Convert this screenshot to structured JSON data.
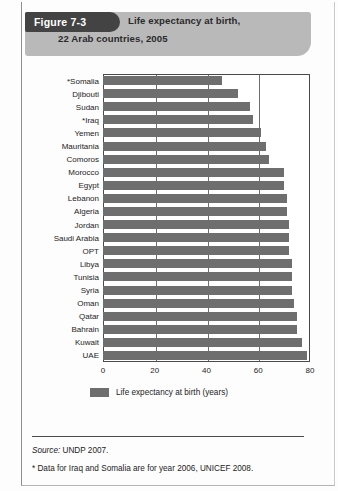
{
  "figure": {
    "tag": "Figure 7-3",
    "title_line1": "Life expectancy at birth,",
    "title_line2": "22 Arab countries, 2005"
  },
  "notes": {
    "source_label": "Source:",
    "source_value": "UNDP 2007.",
    "footnote": "* Data for Iraq and Somalia are for year 2006, UNICEF 2008."
  },
  "colors": {
    "bar": "#6e6e6e",
    "banner": "#b9b9b9",
    "tag_background": "#434343",
    "tag_text": "#ffffff",
    "axis": "#4a4a4a",
    "gridline": "#6e6e6e"
  },
  "chart_data": {
    "type": "bar",
    "orientation": "horizontal",
    "title": "Life expectancy at birth, 22 Arab countries, 2005",
    "xlabel": "",
    "ylabel": "",
    "xlim": [
      0,
      80
    ],
    "xticks": [
      0,
      20,
      40,
      60,
      80
    ],
    "tick_labels": [
      "0",
      "20",
      "40",
      "60",
      "80"
    ],
    "grid": true,
    "legend_position": "bottom",
    "series": [
      {
        "name": "Life expectancy at birth (years)",
        "values": [
          46,
          52,
          57,
          58,
          61,
          63,
          64,
          70,
          70,
          71,
          71,
          72,
          72,
          72,
          73,
          73,
          73,
          74,
          75,
          75,
          77,
          79
        ]
      }
    ],
    "categories": [
      "*Somalia",
      "Djibouti",
      "Sudan",
      "*Iraq",
      "Yemen",
      "Mauritania",
      "Comoros",
      "Morocco",
      "Egypt",
      "Lebanon",
      "Algeria",
      "Jordan",
      "Saudi Arabia",
      "OPT",
      "Libya",
      "Tunisia",
      "Syria",
      "Oman",
      "Qatar",
      "Bahrain",
      "Kuwait",
      "UAE"
    ],
    "legend": [
      "Life expectancy at birth (years)"
    ]
  }
}
